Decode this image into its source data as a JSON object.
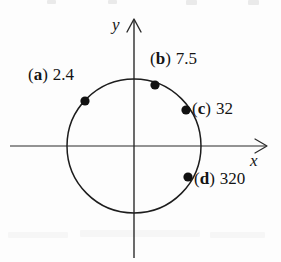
{
  "figure": {
    "type": "unit-circle-diagram",
    "background_color": "#fdfdfd",
    "ink_color": "#141414"
  },
  "axes": {
    "x_label": "x",
    "y_label": "y",
    "origin": {
      "x": 134,
      "y": 146
    },
    "x_arrow": "right",
    "y_arrow": "up"
  },
  "circle": {
    "center_x": 134,
    "center_y": 146,
    "radius": 67
  },
  "points": [
    {
      "tag_open": "(",
      "tag_letter": "a",
      "tag_close": ")",
      "value": "2.4",
      "dot_x": 85,
      "dot_y": 101
    },
    {
      "tag_open": "(",
      "tag_letter": "b",
      "tag_close": ")",
      "value": "7.5",
      "dot_x": 155,
      "dot_y": 85
    },
    {
      "tag_open": "(",
      "tag_letter": "c",
      "tag_close": ")",
      "value": "32",
      "dot_x": 186,
      "dot_y": 110
    },
    {
      "tag_open": "(",
      "tag_letter": "d",
      "tag_close": ")",
      "value": "320",
      "dot_x": 188,
      "dot_y": 177
    }
  ]
}
